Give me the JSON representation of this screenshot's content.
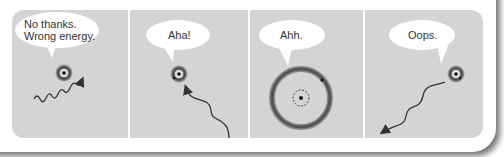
{
  "colors": {
    "panel_bg": "#d4d4d4",
    "bubble_bg": "#ffffff",
    "ink": "#333333",
    "divider": "#ffffff"
  },
  "panels": [
    {
      "id": "panel-1",
      "speech": "No thanks.\nWrong energy.",
      "speech_lines": [
        "No thanks.",
        "Wrong energy."
      ],
      "scene": "photon with wrong energy passes by atom"
    },
    {
      "id": "panel-2",
      "speech": "Aha!",
      "scene": "photon approaches atom and is absorbed"
    },
    {
      "id": "panel-3",
      "speech": "Ahh.",
      "scene": "atom in excited state with electron in large outer orbit"
    },
    {
      "id": "panel-4",
      "speech": "Oops.",
      "scene": "atom emits photon and returns to ground state"
    }
  ]
}
